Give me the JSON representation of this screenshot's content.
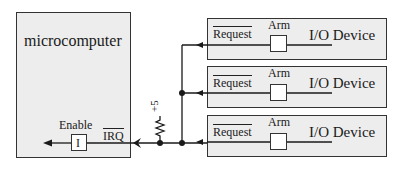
{
  "microcomputer": {
    "label": "microcomputer",
    "enable_label": "Enable",
    "enable_box_label": "I",
    "irq_label": "IRQ"
  },
  "pullup": {
    "label": "+5"
  },
  "devices": [
    {
      "request_label": "Request",
      "arm_label": "Arm",
      "device_label": "I/O Device"
    },
    {
      "request_label": "Request",
      "arm_label": "Arm",
      "device_label": "I/O Device"
    },
    {
      "request_label": "Request",
      "arm_label": "Arm",
      "device_label": "I/O Device"
    }
  ],
  "colors": {
    "box_fill": "#ededed",
    "line": "#1a1a1a"
  }
}
